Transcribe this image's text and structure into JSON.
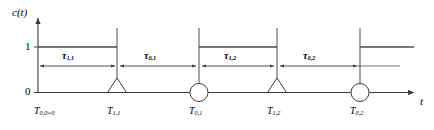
{
  "figure": {
    "type": "timing-diagram",
    "axes": {
      "y_axis_label": "c(t)",
      "x_axis_label": "t",
      "y_ticks": [
        "1",
        "0"
      ],
      "y_tick_one": "1",
      "y_tick_zero": "0"
    },
    "colors": {
      "line": "#3a3a3a",
      "signal": "#4a4a4a",
      "text": "#000000",
      "background": "#ffffff"
    },
    "events": [
      {
        "id": "t00",
        "label_base": "T",
        "label_sub": "0,0=0",
        "marker": "none",
        "x": 38
      },
      {
        "id": "t11",
        "label_base": "T",
        "label_sub": "1,1",
        "marker": "triangle",
        "x": 117
      },
      {
        "id": "t01",
        "label_base": "T",
        "label_sub": "0,1",
        "marker": "circle",
        "x": 199
      },
      {
        "id": "t12",
        "label_base": "T",
        "label_sub": "1,2",
        "marker": "triangle",
        "x": 277
      },
      {
        "id": "t02",
        "label_base": "T",
        "label_sub": "0,2",
        "marker": "circle",
        "x": 360
      }
    ],
    "intervals": [
      {
        "id": "tau11",
        "label_base": "τ",
        "label_sub": "1,1",
        "from": 38,
        "to": 117
      },
      {
        "id": "tau01",
        "label_base": "τ",
        "label_sub": "0,1",
        "from": 117,
        "to": 199
      },
      {
        "id": "tau12",
        "label_base": "τ",
        "label_sub": "1,2",
        "from": 199,
        "to": 277
      },
      {
        "id": "tau02",
        "label_base": "τ",
        "label_sub": "0,2",
        "from": 277,
        "to": 360
      }
    ],
    "signal_segments": [
      {
        "level": "1",
        "from": 38,
        "to": 117
      },
      {
        "level": "1",
        "from": 199,
        "to": 277
      },
      {
        "level": "1",
        "from": 360,
        "to": 415
      }
    ]
  }
}
